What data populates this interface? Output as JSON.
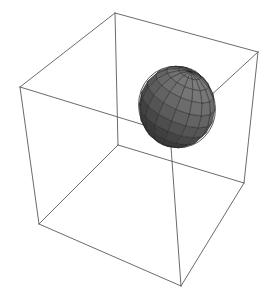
{
  "figure": {
    "background_color": "#ffffff",
    "width": 271,
    "height": 304
  },
  "chart_data": {
    "type": "scatter",
    "title": "",
    "subtitle": "",
    "xlabel": "",
    "ylabel": "",
    "zlabel": "",
    "grid": false,
    "legend": null,
    "projection": "3d-wireframe-bounding-box",
    "axis_ticks_visible": false,
    "axis_labels_visible": false,
    "bounding_box": {
      "name": "cube-wireframe",
      "stroke_color": "#5a5a5a",
      "stroke_width": 0.9,
      "visible_edges": 9,
      "hidden_edges_drawn": 3,
      "vertices_screen": {
        "top_back": [
          115,
          13
        ],
        "top_left": [
          20,
          87
        ],
        "top_right": [
          258,
          52
        ],
        "top_front": [
          170,
          133
        ],
        "bottom_back": [
          118,
          145
        ],
        "bottom_left": [
          39,
          224
        ],
        "bottom_right": [
          244,
          183
        ],
        "bottom_front": [
          181,
          286
        ]
      },
      "edges": [
        [
          "top_back",
          "top_left"
        ],
        [
          "top_back",
          "top_right"
        ],
        [
          "top_left",
          "top_front"
        ],
        [
          "top_right",
          "top_front"
        ],
        [
          "top_left",
          "bottom_left"
        ],
        [
          "top_right",
          "bottom_right"
        ],
        [
          "top_front",
          "bottom_front"
        ],
        [
          "top_back",
          "bottom_back"
        ],
        [
          "bottom_back",
          "bottom_left"
        ],
        [
          "bottom_back",
          "bottom_right"
        ],
        [
          "bottom_left",
          "bottom_front"
        ],
        [
          "bottom_right",
          "bottom_front"
        ]
      ]
    },
    "object": {
      "name": "ellipsoid-mesh",
      "shape": "ellipsoid",
      "surface_style": "faceted-quad-mesh",
      "center_screen": [
        177,
        107
      ],
      "radius_x_px": 38,
      "radius_y_px": 41,
      "rotation_deg": -22,
      "facet_fill_min": "#3a3a3a",
      "facet_fill_max": "#7c7c7c",
      "facet_edge_color": "#1e1e1e",
      "outline_color": "#262626",
      "mesh_u_divisions": 16,
      "mesh_v_divisions": 10,
      "light_direction": "upper-right"
    }
  }
}
